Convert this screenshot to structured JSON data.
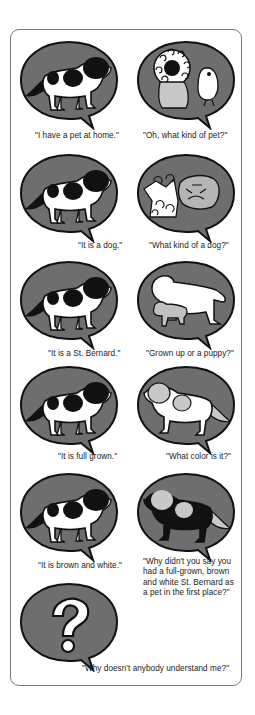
{
  "comic": {
    "colors": {
      "bubble_fill": "#6e6e6e",
      "outline": "#111111",
      "dog_white": "#ffffff",
      "patch_black": "#111111",
      "patch_gray": "#c8c8c8",
      "frame_border": "#7a7a7a"
    },
    "panels": [
      {
        "id": 1,
        "illustration": "st-bernard-dog",
        "caption": "\"I have a pet at home.\""
      },
      {
        "id": 2,
        "illustration": "lion-and-owl",
        "caption": "\"Oh, what kind of pet?\""
      },
      {
        "id": 3,
        "illustration": "st-bernard-dog",
        "caption": "\"It is a dog.\""
      },
      {
        "id": 4,
        "illustration": "poodle-and-bulldog",
        "caption": "\"What kind of a dog?\""
      },
      {
        "id": 5,
        "illustration": "st-bernard-dog",
        "caption": "\"It is a St. Bernard.\""
      },
      {
        "id": 6,
        "illustration": "big-dog-and-puppy",
        "caption": "\"Grown up or a puppy?\""
      },
      {
        "id": 7,
        "illustration": "st-bernard-dog",
        "caption": "\"It is full grown.\""
      },
      {
        "id": 8,
        "illustration": "gray-patched-dog",
        "caption": "\"What color is it?\""
      },
      {
        "id": 9,
        "illustration": "st-bernard-dog",
        "caption": "\"It is brown and white.\""
      },
      {
        "id": 10,
        "illustration": "black-dog-light-patches",
        "caption": "\"Why didn't you say you had a full-grown, brown and white St. Bernard as a pet in the first place?\""
      },
      {
        "id": 11,
        "illustration": "question-mark",
        "caption": "\"Why doesn't anybody understand me?\""
      }
    ]
  }
}
